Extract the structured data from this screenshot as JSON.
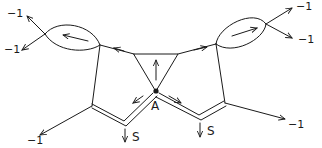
{
  "diagram": {
    "type": "hand-drawn graph / Feynman-style diagram",
    "labels": {
      "left_up_weight": "−1",
      "left_down_weight": "−1",
      "right_up_weight": "−1",
      "right_down_weight": "−1",
      "bottom_left_weight": "−1",
      "bottom_right_weight": "−1",
      "vertex_a": "A",
      "source_left": "S",
      "source_right": "S"
    },
    "colors": {
      "ink": "#1a1a1a",
      "background": "#ffffff"
    }
  }
}
